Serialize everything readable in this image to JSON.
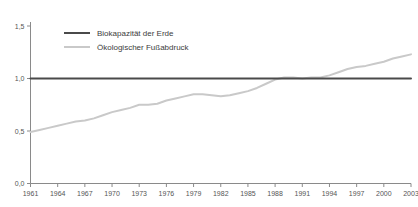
{
  "chart_data": {
    "type": "line",
    "title": "",
    "subtitle": "",
    "xlabel": "",
    "ylabel": "",
    "xlim": [
      1961,
      2003
    ],
    "ylim": [
      0.0,
      1.55
    ],
    "grid": false,
    "legend_position": "top-left-inside",
    "y_ticks": [
      "0,0",
      "0,5",
      "1,0",
      "1,5"
    ],
    "y_tick_values": [
      0.0,
      0.5,
      1.0,
      1.5
    ],
    "x_ticks": [
      "1961",
      "1964",
      "1967",
      "1970",
      "1973",
      "1976",
      "1979",
      "1982",
      "1985",
      "1988",
      "1991",
      "1994",
      "1997",
      "2000",
      "2003"
    ],
    "x_tick_values": [
      1961,
      1964,
      1967,
      1970,
      1973,
      1976,
      1979,
      1982,
      1985,
      1988,
      1991,
      1994,
      1997,
      2000,
      2003
    ],
    "x": [
      1961,
      1962,
      1963,
      1964,
      1965,
      1966,
      1967,
      1968,
      1969,
      1970,
      1971,
      1972,
      1973,
      1974,
      1975,
      1976,
      1977,
      1978,
      1979,
      1980,
      1981,
      1982,
      1983,
      1984,
      1985,
      1986,
      1987,
      1988,
      1989,
      1990,
      1991,
      1992,
      1993,
      1994,
      1995,
      1996,
      1997,
      1998,
      1999,
      2000,
      2001,
      2002,
      2003
    ],
    "series": [
      {
        "name": "Biokapazität der Erde",
        "color": "#4a4a4a",
        "width": 2.0,
        "values": [
          1.0,
          1.0,
          1.0,
          1.0,
          1.0,
          1.0,
          1.0,
          1.0,
          1.0,
          1.0,
          1.0,
          1.0,
          1.0,
          1.0,
          1.0,
          1.0,
          1.0,
          1.0,
          1.0,
          1.0,
          1.0,
          1.0,
          1.0,
          1.0,
          1.0,
          1.0,
          1.0,
          1.0,
          1.0,
          1.0,
          1.0,
          1.0,
          1.0,
          1.0,
          1.0,
          1.0,
          1.0,
          1.0,
          1.0,
          1.0,
          1.0,
          1.0,
          1.0
        ]
      },
      {
        "name": "Ökologischer Fußabdruck",
        "color": "#c9c9c9",
        "width": 2.0,
        "values": [
          0.49,
          0.51,
          0.53,
          0.55,
          0.57,
          0.59,
          0.6,
          0.62,
          0.65,
          0.68,
          0.7,
          0.72,
          0.75,
          0.75,
          0.76,
          0.79,
          0.81,
          0.83,
          0.85,
          0.85,
          0.84,
          0.83,
          0.84,
          0.86,
          0.88,
          0.91,
          0.95,
          0.99,
          1.01,
          1.01,
          1.0,
          1.01,
          1.01,
          1.03,
          1.06,
          1.09,
          1.11,
          1.12,
          1.14,
          1.16,
          1.19,
          1.21,
          1.23
        ]
      }
    ],
    "legend": [
      {
        "label": "Biokapazität der Erde",
        "color": "#4a4a4a"
      },
      {
        "label": "Ökologischer Fußabdruck",
        "color": "#c9c9c9"
      }
    ],
    "axis_color": "#8a8a8a",
    "text_color": "#555555"
  }
}
